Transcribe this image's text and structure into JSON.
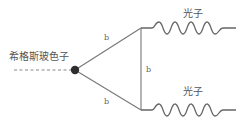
{
  "diagram": {
    "type": "feynman-diagram",
    "incoming": {
      "label": "希格斯玻色子",
      "style": "dashed"
    },
    "vertex": {
      "shape": "filled-circle",
      "color": "#333333"
    },
    "internal_lines": [
      {
        "label": "b",
        "from": "higgs-vertex",
        "to": "upper-vertex"
      },
      {
        "label": "b",
        "from": "higgs-vertex",
        "to": "lower-vertex"
      },
      {
        "label": "b",
        "from": "upper-vertex",
        "to": "lower-vertex"
      }
    ],
    "outgoing": [
      {
        "label": "光子",
        "style": "wavy"
      },
      {
        "label": "光子",
        "style": "wavy"
      }
    ],
    "colors": {
      "line": "#777777",
      "text": "#555555"
    }
  }
}
